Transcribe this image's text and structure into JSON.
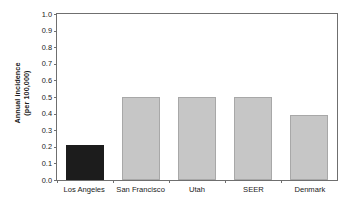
{
  "chart_data": {
    "type": "bar",
    "title": "",
    "xlabel": "",
    "ylabel": "Annual incidence (per 100,000)",
    "ylabel_line1": "Annual incidence",
    "ylabel_line2": "(per 100,000)",
    "categories": [
      "Los Angeles",
      "San Francisco",
      "Utah",
      "SEER",
      "Denmark"
    ],
    "values": [
      0.21,
      0.5,
      0.5,
      0.5,
      0.39
    ],
    "bar_colors": [
      "#1c1c1c",
      "#c6c6c6",
      "#c6c6c6",
      "#c6c6c6",
      "#c6c6c6"
    ],
    "ylim": [
      0.0,
      1.0
    ],
    "ytick_values": [
      1.0,
      0.9,
      0.8,
      0.7,
      0.6,
      0.5,
      0.4,
      0.3,
      0.2,
      0.1,
      0.0
    ],
    "ytick_labels": [
      "1.0",
      "0.9",
      "0.8",
      "0.7",
      "0.6",
      "0.5",
      "0.4",
      "0.3",
      "0.2",
      "0.1",
      "0.0"
    ],
    "grid": false,
    "legend": null,
    "annotations": []
  },
  "colors": {
    "highlight_bar": "#1c1c1c",
    "default_bar": "#c6c6c6",
    "bar_border": "#a8a8a8",
    "axis": "#6f6f6f",
    "background": "#ffffff",
    "text": "#1a1a1a"
  }
}
